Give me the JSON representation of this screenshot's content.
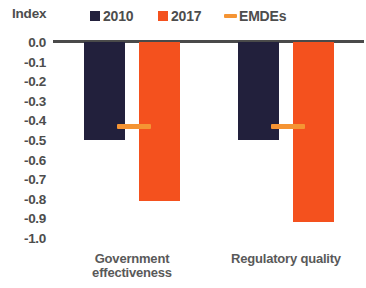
{
  "chart_data": {
    "type": "bar",
    "title": "",
    "ylabel": "Index",
    "xlabel": "",
    "ylim": [
      -1.0,
      0.0
    ],
    "grid": false,
    "legend_position": "top",
    "categories": [
      "Government effectiveness",
      "Regulatory quality"
    ],
    "category_lines": [
      [
        "Government",
        "effectiveness"
      ],
      [
        "Regulatory quality"
      ]
    ],
    "ytick_labels": [
      "0.0",
      "-0.1",
      "-0.2",
      "-0.3",
      "-0.4",
      "-0.5",
      "-0.6",
      "-0.7",
      "-0.8",
      "-0.9",
      "-1.0"
    ],
    "ytick_values": [
      0.0,
      -0.1,
      -0.2,
      -0.3,
      -0.4,
      -0.5,
      -0.6,
      -0.7,
      -0.8,
      -0.9,
      -1.0
    ],
    "series": [
      {
        "name": "2010",
        "type": "bar",
        "color": "#22203c",
        "values": [
          -0.5,
          -0.5
        ]
      },
      {
        "name": "2017",
        "type": "bar",
        "color": "#f4511e",
        "values": [
          -0.81,
          -0.92
        ]
      },
      {
        "name": "EMDEs",
        "type": "marker",
        "color": "#f59433",
        "values": [
          -0.43,
          -0.43
        ]
      }
    ]
  },
  "legend": {
    "items": [
      {
        "label": "2010",
        "marker": "square",
        "color": "#22203c"
      },
      {
        "label": "2017",
        "marker": "square",
        "color": "#f4511e"
      },
      {
        "label": "EMDEs",
        "marker": "dash",
        "color": "#f59433"
      }
    ]
  },
  "axis": {
    "y_title": "Index"
  }
}
